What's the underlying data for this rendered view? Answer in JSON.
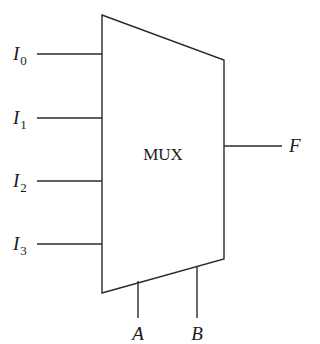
{
  "diagram": {
    "type": "multiplexer",
    "block_label": "MUX",
    "inputs": [
      {
        "name": "I",
        "sub": "0",
        "y": 54
      },
      {
        "name": "I",
        "sub": "1",
        "y": 118
      },
      {
        "name": "I",
        "sub": "2",
        "y": 181
      },
      {
        "name": "I",
        "sub": "3",
        "y": 244
      }
    ],
    "output": {
      "name": "F"
    },
    "selects": [
      {
        "name": "A"
      },
      {
        "name": "B"
      }
    ],
    "colors": {
      "line": "#2a2a2a",
      "text": "#1a1a1a",
      "background": "#ffffff"
    }
  }
}
